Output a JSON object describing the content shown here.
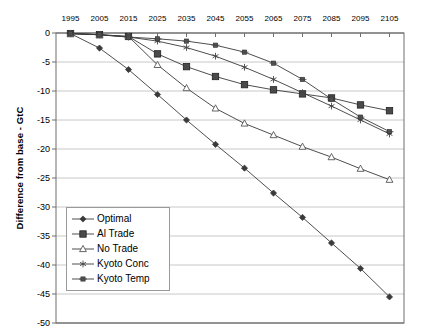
{
  "chart_data": {
    "type": "line",
    "title": "",
    "xlabel": "",
    "ylabel": "Difference from base - GtC",
    "x": [
      1995,
      2005,
      2015,
      2025,
      2035,
      2045,
      2055,
      2065,
      2075,
      2085,
      2095,
      2105
    ],
    "xlim": [
      1990,
      2110
    ],
    "ylim": [
      -50,
      0
    ],
    "yticks": [
      0,
      -5,
      -10,
      -15,
      -20,
      -25,
      -30,
      -35,
      -40,
      -45,
      -50
    ],
    "ytick_labels": [
      "0",
      "-5",
      "-10",
      "-15",
      "-20",
      "-25",
      "-30",
      "-35",
      "-40",
      "-45",
      "-50"
    ],
    "xtick_labels": [
      "1995",
      "2005",
      "2015",
      "2025",
      "2035",
      "2045",
      "2055",
      "2065",
      "2075",
      "2085",
      "2095",
      "2105"
    ],
    "grid": "horizontal",
    "legend_position": "inside-lower-left",
    "series": [
      {
        "name": "Optimal",
        "marker": "filled-diamond",
        "values": [
          -0.1,
          -2.6,
          -6.3,
          -10.6,
          -15.0,
          -19.2,
          -23.3,
          -27.6,
          -31.8,
          -36.2,
          -40.6,
          -45.5
        ]
      },
      {
        "name": "Al Trade",
        "marker": "filled-square",
        "values": [
          -0.1,
          -0.3,
          -0.6,
          -3.6,
          -5.8,
          -7.5,
          -8.9,
          -9.8,
          -10.5,
          -11.2,
          -12.4,
          -13.4
        ]
      },
      {
        "name": "No Trade",
        "marker": "open-triangle",
        "values": [
          -0.1,
          -0.3,
          -0.6,
          -5.5,
          -9.5,
          -13.0,
          -15.6,
          -17.6,
          -19.6,
          -21.4,
          -23.4,
          -25.3
        ]
      },
      {
        "name": "Kyoto Conc",
        "marker": "asterisk",
        "values": [
          -0.1,
          -0.3,
          -0.7,
          -1.4,
          -2.5,
          -4.0,
          -5.9,
          -8.0,
          -10.3,
          -12.6,
          -15.0,
          -17.4
        ]
      },
      {
        "name": "Kyoto Temp",
        "marker": "star-square",
        "values": [
          -0.1,
          -0.3,
          -0.7,
          -1.0,
          -1.4,
          -2.1,
          -3.3,
          -5.2,
          -8.0,
          -11.4,
          -14.5,
          -17.0
        ]
      }
    ]
  },
  "legend": {
    "items": [
      {
        "label": "Optimal"
      },
      {
        "label": "Al Trade"
      },
      {
        "label": "No Trade"
      },
      {
        "label": "Kyoto Conc"
      },
      {
        "label": "Kyoto Temp"
      }
    ]
  },
  "colors": {
    "line": "#3a3a3a",
    "grid": "#c8c8c8",
    "axis": "#6e6e6e",
    "text": "#000000"
  }
}
